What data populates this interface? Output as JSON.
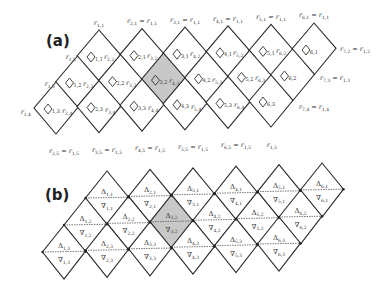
{
  "panels": {
    "a": {
      "label": "(a)",
      "label_pos": [
        46,
        46
      ],
      "origin": [
        99,
        30
      ],
      "col_dx": 43,
      "col_dy": -1.4,
      "row_dx": -21.5,
      "row_dy": 26,
      "half_w": 22,
      "half_h": 26,
      "shaded": [
        [
          3,
          2
        ]
      ],
      "cells": [
        [
          1,
          1
        ],
        [
          2,
          1
        ],
        [
          3,
          1
        ],
        [
          4,
          1
        ],
        [
          5,
          1
        ],
        [
          6,
          1
        ],
        [
          1,
          2
        ],
        [
          2,
          2
        ],
        [
          3,
          2
        ],
        [
          4,
          2
        ],
        [
          5,
          2
        ],
        [
          6,
          2
        ],
        [
          1,
          3
        ],
        [
          2,
          3
        ],
        [
          3,
          3
        ],
        [
          4,
          3
        ],
        [
          5,
          3
        ],
        [
          6,
          3
        ]
      ],
      "cell_subscripts": {
        "1,1": "1,1",
        "2,1": "2,1",
        "3,1": "3,1",
        "4,1": "4,1",
        "5,1": "5,1",
        "6,1": "6,1",
        "1,2": "1,2",
        "2,2": "2,2",
        "3,2": "3,2",
        "4,2": "4,2",
        "5,2": "5,2",
        "6,2": "6,2",
        "1,3": "1,3",
        "2,3": "2,3",
        "3,3": "3,3",
        "4,3": "4,3",
        "5,3": "5,3",
        "6,3": "6,3"
      },
      "vertex_labels": [
        {
          "x": 99,
          "y": 25,
          "anchor": "middle",
          "text": "r",
          "sub": "1,1",
          "eq": null
        },
        {
          "x": 142,
          "y": 23,
          "anchor": "middle",
          "text": "r",
          "sub": "2,1",
          "eq": "1,1"
        },
        {
          "x": 185,
          "y": 22,
          "anchor": "middle",
          "text": "r",
          "sub": "3,1",
          "eq": "1,1"
        },
        {
          "x": 228,
          "y": 21,
          "anchor": "middle",
          "text": "r",
          "sub": "4,1",
          "eq": "1,1"
        },
        {
          "x": 271,
          "y": 19,
          "anchor": "middle",
          "text": "r",
          "sub": "5,1",
          "eq": "1,1"
        },
        {
          "x": 314,
          "y": 17,
          "anchor": "middle",
          "text": "r",
          "sub": "6,1",
          "eq": "1,1"
        },
        {
          "x": 76,
          "y": 59,
          "anchor": "end",
          "text": "r",
          "sub": "1,2",
          "eq": null
        },
        {
          "x": 104,
          "y": 59,
          "anchor": "start",
          "text": "r",
          "sub": "2,2",
          "eq": null
        },
        {
          "x": 147,
          "y": 58,
          "anchor": "start",
          "text": "r",
          "sub": "3,2",
          "eq": null
        },
        {
          "x": 190,
          "y": 56,
          "anchor": "start",
          "text": "r",
          "sub": "4,2",
          "eq": null
        },
        {
          "x": 233,
          "y": 55,
          "anchor": "start",
          "text": "r",
          "sub": "5,2",
          "eq": null
        },
        {
          "x": 276,
          "y": 53,
          "anchor": "start",
          "text": "r",
          "sub": "6,2",
          "eq": null
        },
        {
          "x": 340,
          "y": 51,
          "anchor": "start",
          "text": "r",
          "sub": "7,2",
          "eq": "1,2"
        },
        {
          "x": 55,
          "y": 86,
          "anchor": "end",
          "text": "r",
          "sub": "1,3",
          "eq": null
        },
        {
          "x": 83,
          "y": 86,
          "anchor": "start",
          "text": "r",
          "sub": "2,3",
          "eq": null
        },
        {
          "x": 126,
          "y": 85,
          "anchor": "start",
          "text": "r",
          "sub": "3,3",
          "eq": null
        },
        {
          "x": 169,
          "y": 83,
          "anchor": "start",
          "text": "r",
          "sub": "4,3",
          "eq": null
        },
        {
          "x": 212,
          "y": 82,
          "anchor": "start",
          "text": "r",
          "sub": "5,3",
          "eq": null
        },
        {
          "x": 255,
          "y": 80,
          "anchor": "start",
          "text": "r",
          "sub": "6,3",
          "eq": null
        },
        {
          "x": 320,
          "y": 80,
          "anchor": "start",
          "text": "r",
          "sub": "7,3",
          "eq": "1,3"
        },
        {
          "x": 31,
          "y": 114,
          "anchor": "end",
          "text": "r",
          "sub": "1,4",
          "eq": null
        },
        {
          "x": 62,
          "y": 113,
          "anchor": "start",
          "text": "r",
          "sub": "2,4",
          "eq": null
        },
        {
          "x": 105,
          "y": 112,
          "anchor": "start",
          "text": "r",
          "sub": "3,4",
          "eq": null
        },
        {
          "x": 148,
          "y": 110,
          "anchor": "start",
          "text": "r",
          "sub": "4,4",
          "eq": null
        },
        {
          "x": 191,
          "y": 109,
          "anchor": "start",
          "text": "r",
          "sub": "5,4",
          "eq": null
        },
        {
          "x": 234,
          "y": 107,
          "anchor": "start",
          "text": "r",
          "sub": "6,4",
          "eq": null
        },
        {
          "x": 299,
          "y": 109,
          "anchor": "start",
          "text": "r",
          "sub": "7,4",
          "eq": "1,4"
        },
        {
          "x": 64,
          "y": 153,
          "anchor": "middle",
          "text": "r",
          "sub": "2,5",
          "eq": "1,5"
        },
        {
          "x": 107,
          "y": 152,
          "anchor": "middle",
          "text": "r",
          "sub": "3,5",
          "eq": "1,5"
        },
        {
          "x": 150,
          "y": 150,
          "anchor": "middle",
          "text": "r",
          "sub": "4,5",
          "eq": "1,5"
        },
        {
          "x": 193,
          "y": 149,
          "anchor": "middle",
          "text": "r",
          "sub": "5,5",
          "eq": "1,5"
        },
        {
          "x": 236,
          "y": 147,
          "anchor": "middle",
          "text": "r",
          "sub": "6,5",
          "eq": "1,5"
        },
        {
          "x": 272,
          "y": 147,
          "anchor": "middle",
          "text": "r",
          "sub": "1,5",
          "eq": null
        }
      ]
    },
    "b": {
      "label": "(b)",
      "label_pos": [
        45,
        200
      ],
      "origin": [
        107,
        171
      ],
      "col_dx": 43,
      "col_dy": -1.6,
      "row_dx": -21.5,
      "row_dy": 27,
      "half_w": 21.5,
      "half_h": 27,
      "shaded": [
        [
          3,
          2
        ]
      ],
      "cells": [
        [
          1,
          1
        ],
        [
          2,
          1
        ],
        [
          3,
          1
        ],
        [
          4,
          1
        ],
        [
          5,
          1
        ],
        [
          6,
          1
        ],
        [
          1,
          2
        ],
        [
          2,
          2
        ],
        [
          3,
          2
        ],
        [
          4,
          2
        ],
        [
          5,
          2
        ],
        [
          6,
          2
        ],
        [
          1,
          3
        ],
        [
          2,
          3
        ],
        [
          3,
          3
        ],
        [
          4,
          3
        ],
        [
          5,
          3
        ],
        [
          6,
          3
        ]
      ],
      "up_symbol": "Δ",
      "down_symbol": "∇"
    }
  }
}
